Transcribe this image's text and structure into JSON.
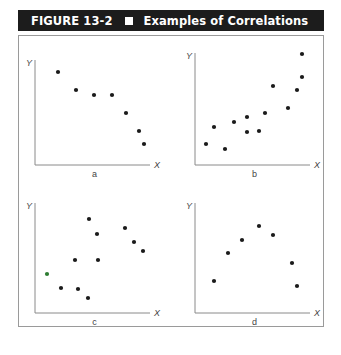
{
  "header": {
    "figure_label": "FIGURE 13-2",
    "title": "Examples of Correlations"
  },
  "chart_data": [
    {
      "type": "scatter",
      "panel": "a",
      "title": "",
      "xlabel": "X",
      "ylabel": "Y",
      "caption": "a",
      "grid": false,
      "description": "negative correlation",
      "points": [
        [
          58,
          72
        ],
        [
          76,
          90
        ],
        [
          94,
          95
        ],
        [
          112,
          95
        ],
        [
          126,
          113
        ],
        [
          139,
          131
        ],
        [
          144,
          144
        ]
      ],
      "axis_origin": [
        35,
        165
      ],
      "axis_end": [
        150,
        60
      ]
    },
    {
      "type": "scatter",
      "panel": "b",
      "title": "",
      "xlabel": "X",
      "ylabel": "Y",
      "caption": "b",
      "grid": false,
      "description": "positive correlation",
      "points": [
        [
          206,
          144
        ],
        [
          214,
          127
        ],
        [
          225,
          149
        ],
        [
          234,
          122
        ],
        [
          247,
          117
        ],
        [
          247,
          132
        ],
        [
          259,
          131
        ],
        [
          265,
          113
        ],
        [
          273,
          86
        ],
        [
          288,
          108
        ],
        [
          297,
          90
        ],
        [
          302,
          77
        ],
        [
          302,
          54
        ]
      ],
      "axis_origin": [
        195,
        165
      ],
      "axis_end": [
        310,
        53
      ]
    },
    {
      "type": "scatter",
      "panel": "c",
      "title": "",
      "xlabel": "X",
      "ylabel": "Y",
      "caption": "c",
      "grid": false,
      "description": "no correlation",
      "points": [
        [
          47,
          274
        ],
        [
          61,
          288
        ],
        [
          78,
          289
        ],
        [
          88,
          298
        ],
        [
          75,
          260
        ],
        [
          98,
          260
        ],
        [
          89,
          219
        ],
        [
          97,
          234
        ],
        [
          125,
          228
        ],
        [
          134,
          242
        ],
        [
          143,
          251
        ]
      ],
      "highlight_point_index": 0,
      "highlight_color": "#2e7d32",
      "axis_origin": [
        35,
        313
      ],
      "axis_end": [
        150,
        203
      ]
    },
    {
      "type": "scatter",
      "panel": "d",
      "title": "",
      "xlabel": "X",
      "ylabel": "Y",
      "caption": "d",
      "grid": false,
      "description": "curvilinear relationship",
      "points": [
        [
          214,
          281
        ],
        [
          228,
          253
        ],
        [
          242,
          240
        ],
        [
          259,
          226
        ],
        [
          273,
          235
        ],
        [
          292,
          263
        ],
        [
          297,
          286
        ]
      ],
      "axis_origin": [
        195,
        313
      ],
      "axis_end": [
        310,
        203
      ]
    }
  ],
  "colors": {
    "header_bg": "#1c1c1c",
    "header_text": "#ffffff",
    "point": "#1a1a1a",
    "axis": "#8a8a8a",
    "frame": "#9a9a9a"
  }
}
